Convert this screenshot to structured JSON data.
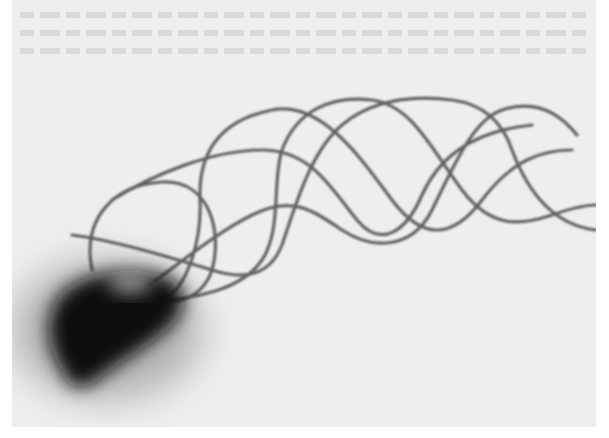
{
  "image": {
    "kind": "grayscale micrograph",
    "subject": "flagellated cell body with helical flagellar bundle",
    "description": "Dark irregular cell body at lower-left with several intertwined wavy flagellar filaments extending toward the upper right",
    "colors": {
      "page_background": "#ffffff",
      "plate_background": "#eeeeee",
      "cell_body": "#111111",
      "filament": "#4a4a4a"
    }
  }
}
